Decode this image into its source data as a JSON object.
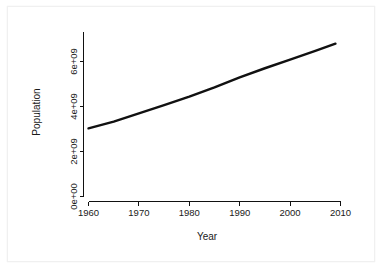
{
  "chart_data": {
    "type": "line",
    "title": "",
    "xlabel": "Year",
    "ylabel": "Population",
    "xlim": [
      1958,
      2011
    ],
    "ylim": [
      0,
      7400000000
    ],
    "grid": false,
    "legend": null,
    "xticks": [
      "1960",
      "1970",
      "1980",
      "1990",
      "2000",
      "2010"
    ],
    "xtick_values": [
      1960,
      1970,
      1980,
      1990,
      2000,
      2010
    ],
    "yticks": [
      "0e+00",
      "2e+09",
      "4e+09",
      "6e+09"
    ],
    "ytick_values": [
      0,
      2000000000,
      4000000000,
      6000000000
    ],
    "series": [
      {
        "name": "Population",
        "x": [
          1960,
          1965,
          1970,
          1975,
          1980,
          1985,
          1990,
          1995,
          2000,
          2005,
          2009
        ],
        "values": [
          3030000000,
          3330000000,
          3690000000,
          4060000000,
          4440000000,
          4850000000,
          5290000000,
          5700000000,
          6080000000,
          6470000000,
          6790000000
        ]
      }
    ]
  },
  "axes": {
    "x_title": "Year",
    "y_title": "Population"
  }
}
